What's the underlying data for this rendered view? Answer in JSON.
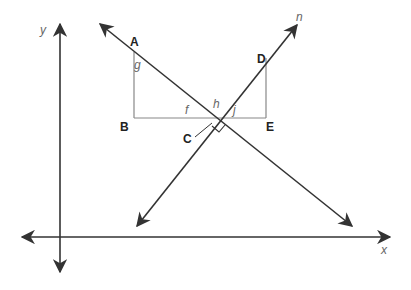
{
  "diagram": {
    "axes": {
      "x_label": "x",
      "y_label": "y"
    },
    "points": {
      "A": "A",
      "B": "B",
      "C": "C",
      "D": "D",
      "E": "E"
    },
    "angles": {
      "g": "g",
      "f": "f",
      "h": "h",
      "j": "j"
    },
    "line_label": "n",
    "colors": {
      "line": "#333333",
      "segment": "#888888"
    }
  }
}
